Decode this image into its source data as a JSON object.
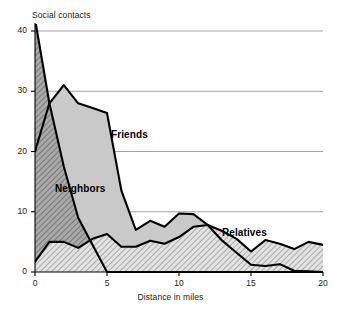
{
  "chart_data": {
    "type": "area",
    "title": "",
    "xlabel": "Distance in miles",
    "ylabel": "Social contacts",
    "xlim": [
      0,
      20
    ],
    "ylim": [
      0,
      42
    ],
    "grid": true,
    "grid_axis": "y",
    "legend_position": "inline-annotations",
    "xticks": [
      0,
      5,
      10,
      15,
      20
    ],
    "yticks": [
      0,
      10,
      20,
      30,
      40
    ],
    "x": [
      0,
      1,
      2,
      3,
      4,
      5,
      6,
      7,
      8,
      9,
      10,
      11,
      12,
      13,
      14,
      15,
      16,
      17,
      18,
      19,
      20
    ],
    "series": [
      {
        "name": "Neighbors",
        "fill": "#a8a8a8",
        "pattern": "dense-diagonal-hatch",
        "values": [
          42,
          28,
          17.5,
          9,
          4.5,
          0,
          0,
          0,
          0,
          0,
          0,
          0,
          0,
          0,
          0,
          0,
          0,
          0,
          0,
          0,
          0
        ]
      },
      {
        "name": "Friends",
        "fill": "#c9c9c9",
        "pattern": "solid-gray",
        "values": [
          20,
          28,
          31,
          28,
          27.2,
          26.4,
          13.5,
          7,
          8.5,
          7.5,
          9.7,
          9.6,
          7.8,
          5.2,
          3.2,
          1.2,
          1,
          1.3,
          0.2,
          0.1,
          0
        ]
      },
      {
        "name": "Relatives",
        "fill": "#d8d8d8",
        "pattern": "sparse-diagonal-hatch",
        "values": [
          1.7,
          5,
          5,
          4,
          5.5,
          6.3,
          4.2,
          4.2,
          5.2,
          4.7,
          5.8,
          7.5,
          7.8,
          6.8,
          5.5,
          3.4,
          5.3,
          4.7,
          3.8,
          5,
          4.5
        ]
      }
    ],
    "annotations": [
      {
        "text": "Friends",
        "x_px": 111,
        "y_px": 129
      },
      {
        "text": "Neighbors",
        "x_px": 55,
        "y_px": 183
      },
      {
        "text": "Relatives",
        "x_px": 222,
        "y_px": 227
      }
    ]
  },
  "axes": {
    "y_title": "Social contacts",
    "x_title": "Distance in miles",
    "y_ticks": [
      "0",
      "10",
      "20",
      "30",
      "40"
    ],
    "x_ticks": [
      "0",
      "5",
      "10",
      "15",
      "20"
    ]
  },
  "labels": {
    "friends": "Friends",
    "neighbors": "Neighbors",
    "relatives": "Relatives"
  },
  "colors": {
    "neighbors_fill": "#a8a8a8",
    "friends_fill": "#c9c9c9",
    "relatives_fill": "#d8d8d8",
    "line": "#000000",
    "grid": "#8c8c8c",
    "background": "#ffffff"
  }
}
